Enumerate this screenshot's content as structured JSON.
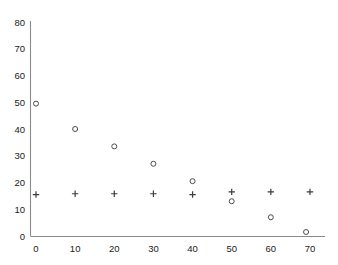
{
  "chart_data": {
    "type": "scatter",
    "title": "",
    "subtitle": "",
    "xlabel": "",
    "ylabel": "",
    "xlim": [
      0,
      73
    ],
    "ylim": [
      0,
      80
    ],
    "grid": false,
    "legend_position": "none",
    "x_ticks": [
      0,
      10,
      20,
      30,
      40,
      50,
      60,
      70
    ],
    "x_tick_labels": [
      "0",
      "10",
      "20",
      "30",
      "40",
      "50",
      "60",
      "70"
    ],
    "y_ticks": [
      0,
      10,
      20,
      30,
      40,
      50,
      60,
      70,
      80
    ],
    "y_tick_labels": [
      "0",
      "10",
      "20",
      "30",
      "40",
      "50",
      "60",
      "70",
      "80"
    ],
    "series": [
      {
        "name": "circle-series",
        "marker": "circle",
        "color": "#4a4a52",
        "points": [
          {
            "x": 0,
            "y": 49.5
          },
          {
            "x": 10,
            "y": 40.0
          },
          {
            "x": 20,
            "y": 33.5
          },
          {
            "x": 30,
            "y": 27.0
          },
          {
            "x": 40,
            "y": 20.5
          },
          {
            "x": 50,
            "y": 13.0
          },
          {
            "x": 60,
            "y": 7.0
          },
          {
            "x": 69,
            "y": 1.5
          }
        ]
      },
      {
        "name": "plus-series",
        "marker": "plus",
        "color": "#3a3a42",
        "points": [
          {
            "x": 0,
            "y": 15.5
          },
          {
            "x": 10,
            "y": 15.8
          },
          {
            "x": 20,
            "y": 15.8
          },
          {
            "x": 30,
            "y": 15.8
          },
          {
            "x": 40,
            "y": 15.5
          },
          {
            "x": 50,
            "y": 16.5
          },
          {
            "x": 60,
            "y": 16.5
          },
          {
            "x": 70,
            "y": 16.5
          }
        ]
      }
    ]
  }
}
